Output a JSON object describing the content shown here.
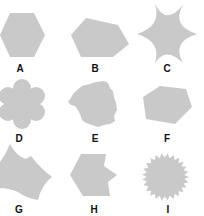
{
  "figure": {
    "shape_color": "#c9c9c9",
    "label_color": "#111111",
    "items": [
      {
        "label": "A",
        "shape": "regular hexagon"
      },
      {
        "label": "B",
        "shape": "irregular pentagon"
      },
      {
        "label": "C",
        "shape": "six-pointed concave star"
      },
      {
        "label": "D",
        "shape": "six-petal flower"
      },
      {
        "label": "E",
        "shape": "irregular rough blob"
      },
      {
        "label": "F",
        "shape": "irregular hexagon"
      },
      {
        "label": "G",
        "shape": "irregular shape with curved edges"
      },
      {
        "label": "H",
        "shape": "irregular octagon with notches"
      },
      {
        "label": "I",
        "shape": "serrated circle / starburst"
      }
    ]
  }
}
